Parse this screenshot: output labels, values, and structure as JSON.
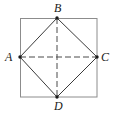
{
  "figure": {
    "kind": "geometry-diagram",
    "background_color": "#ffffff",
    "outer_square": {
      "name": "outer-square",
      "x": 20,
      "y": 18,
      "width": 77,
      "height": 79,
      "stroke_color": "#8c8c8c",
      "stroke_width": 1,
      "fill": "none",
      "dashed": false
    },
    "inscribed_diamond": {
      "name": "inscribed-diamond",
      "stroke_color": "#3a3a3a",
      "stroke_width": 1,
      "fill": "none",
      "dashed": false,
      "points": "20,57 57,18 97,57 57,97"
    },
    "diagonals": [
      {
        "name": "diagonal-AC",
        "from": "A",
        "to": "C",
        "x1": 20,
        "y1": 57,
        "x2": 97,
        "y2": 57,
        "dashed": true,
        "dash_pattern": "6,3",
        "stroke_color": "#4a4a4a",
        "stroke_width": 1
      },
      {
        "name": "diagonal-BD",
        "from": "B",
        "to": "D",
        "x1": 57,
        "y1": 18,
        "x2": 57,
        "y2": 97,
        "dashed": true,
        "dash_pattern": "6,3",
        "stroke_color": "#4a4a4a",
        "stroke_width": 1
      }
    ],
    "vertices": [
      {
        "id": "A",
        "label": "A",
        "x": 20,
        "y": 57,
        "dot": true,
        "dot_radius": 1.7,
        "dot_color": "#1a1a1a",
        "label_position": "left"
      },
      {
        "id": "B",
        "label": "B",
        "x": 57,
        "y": 18,
        "dot": true,
        "dot_radius": 1.7,
        "dot_color": "#1a1a1a",
        "label_position": "above"
      },
      {
        "id": "C",
        "label": "C",
        "x": 97,
        "y": 57,
        "dot": true,
        "dot_radius": 1.7,
        "dot_color": "#1a1a1a",
        "label_position": "right"
      },
      {
        "id": "D",
        "label": "D",
        "x": 57,
        "y": 97,
        "dot": true,
        "dot_radius": 1.7,
        "dot_color": "#1a1a1a",
        "label_position": "below"
      }
    ]
  }
}
